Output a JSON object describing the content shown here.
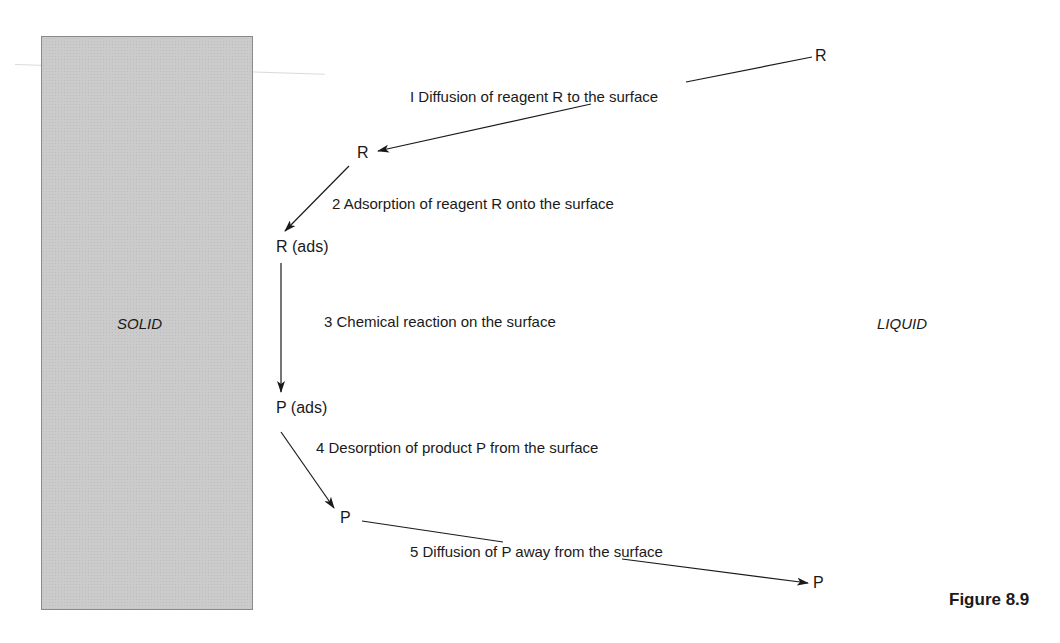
{
  "phases": {
    "solid": "SOLID",
    "liquid": "LIQUID"
  },
  "species": {
    "r_bulk": "R",
    "r_near": "R",
    "r_ads": "R (ads)",
    "p_ads": "P (ads)",
    "p_near": "P",
    "p_bulk": "P"
  },
  "steps": [
    {
      "label": "I Diffusion of reagent R to the surface"
    },
    {
      "label": "2 Adsorption of reagent R onto the surface"
    },
    {
      "label": "3 Chemical reaction on the surface"
    },
    {
      "label": "4 Desorption of product P from the surface"
    },
    {
      "label": "5 Diffusion of P away from the surface"
    }
  ],
  "caption": "Figure 8.9",
  "colors": {
    "solid_fill": "#cbcbcb",
    "solid_border": "#8a8a8a",
    "line": "#1a1a1a"
  }
}
